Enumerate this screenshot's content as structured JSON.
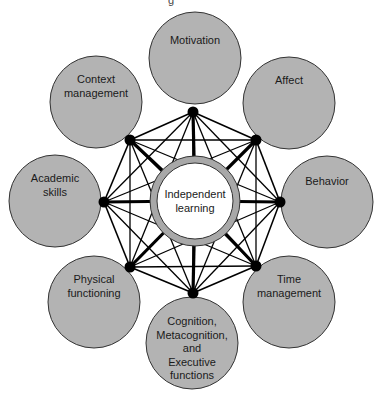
{
  "figure": {
    "clipped_top_text": "g",
    "center": {
      "label_lines": [
        "Independent",
        "learning"
      ],
      "x": 195,
      "y": 201,
      "r_outer": 45,
      "r_inner": 38,
      "ring_color": "#a8a8a8"
    },
    "node_fill": "#b3b3b3",
    "node_stroke": "#333333",
    "line_color": "#000000",
    "nodes": [
      {
        "id": "motivation",
        "label_lines": [
          "Motivation"
        ],
        "cx": 195,
        "cy": 58,
        "r": 46,
        "jx": 193,
        "jy": 112,
        "ty": 44
      },
      {
        "id": "affect",
        "label_lines": [
          "Affect"
        ],
        "cx": 289,
        "cy": 103,
        "r": 46,
        "jx": 256,
        "jy": 140,
        "ty": 84
      },
      {
        "id": "behavior",
        "label_lines": [
          "Behavior"
        ],
        "cx": 327,
        "cy": 202,
        "r": 46,
        "jx": 280,
        "jy": 202,
        "ty": 185
      },
      {
        "id": "time-management",
        "label_lines": [
          "Time",
          "management"
        ],
        "cx": 289,
        "cy": 302,
        "r": 46,
        "jx": 256,
        "jy": 266,
        "ty": 283
      },
      {
        "id": "cognition",
        "label_lines": [
          "Cognition,",
          "Metacognition,",
          "and",
          "Executive",
          "functions"
        ],
        "cx": 192,
        "cy": 343,
        "r": 46,
        "jx": 193,
        "jy": 293,
        "ty": 325
      },
      {
        "id": "physical-functioning",
        "label_lines": [
          "Physical",
          "functioning"
        ],
        "cx": 94,
        "cy": 302,
        "r": 46,
        "jx": 130,
        "jy": 267,
        "ty": 283
      },
      {
        "id": "academic-skills",
        "label_lines": [
          "Academic",
          "skills"
        ],
        "cx": 55,
        "cy": 201,
        "r": 46,
        "jx": 104,
        "jy": 202,
        "ty": 182
      },
      {
        "id": "context-management",
        "label_lines": [
          "Context",
          "management"
        ],
        "cx": 96,
        "cy": 102,
        "r": 46,
        "jx": 130,
        "jy": 140,
        "ty": 83
      }
    ]
  }
}
